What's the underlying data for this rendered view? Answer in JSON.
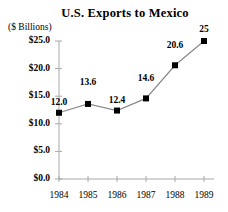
{
  "chart_data": {
    "type": "line",
    "title": "U.S. Exports to Mexico",
    "xlabel": "",
    "ylabel": "($ Billions)",
    "categories": [
      "1984",
      "1985",
      "1986",
      "1987",
      "1988",
      "1989"
    ],
    "values": [
      12.0,
      13.6,
      12.4,
      14.6,
      20.6,
      25
    ],
    "point_labels": [
      "12.0",
      "13.6",
      "12.4",
      "14.6",
      "20.6",
      "25"
    ],
    "ytick_labels": [
      "$0.0",
      "$5.0",
      "$10.0",
      "$15.0",
      "$20.0",
      "$25.0"
    ],
    "ytick_values": [
      0,
      5,
      10,
      15,
      20,
      25
    ],
    "ylim": [
      0,
      25
    ],
    "grid": false,
    "legend": null,
    "marker": "filled-square",
    "colors": {
      "line": "#8a8a8a",
      "marker": "#000000",
      "axis": "#a8a8a8",
      "text": "#000000",
      "background": "#ffffff"
    }
  }
}
